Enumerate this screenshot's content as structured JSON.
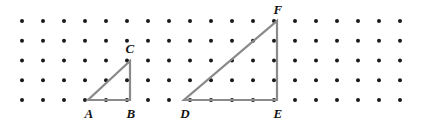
{
  "figure": {
    "width": 427,
    "height": 124,
    "background_color": "#ffffff"
  },
  "grid": {
    "name": "dot-grid",
    "dot_color": "#1a1a1a",
    "dot_radius": 2.0,
    "columns": 19,
    "rows": 5,
    "origin_x": 22,
    "origin_y": 21,
    "step_x": 21,
    "step_y": 19.75
  },
  "style": {
    "line_color": "#8a8a8a",
    "line_width": 2.2,
    "label_color": "#111111"
  },
  "shapes": [
    {
      "name": "triangle-abc",
      "label": "Triangle ABC",
      "points": "88,100 130,100 130,61",
      "vertices": [
        {
          "name": "A",
          "x": 88,
          "y": 100
        },
        {
          "name": "B",
          "x": 130,
          "y": 100
        },
        {
          "name": "C",
          "x": 130,
          "y": 61
        }
      ],
      "legs": {
        "horizontal_units": 2,
        "vertical_units": 2
      }
    },
    {
      "name": "triangle-def",
      "label": "Triangle DEF",
      "points": "184,100 277,100 277,21",
      "vertices": [
        {
          "name": "D",
          "x": 184,
          "y": 100
        },
        {
          "name": "E",
          "x": 277,
          "y": 100
        },
        {
          "name": "F",
          "x": 277,
          "y": 21
        }
      ],
      "legs": {
        "horizontal_units": 4.5,
        "vertical_units": 4
      }
    }
  ],
  "labels": [
    {
      "name": "label-a",
      "text": "A",
      "x": 89,
      "y": 113
    },
    {
      "name": "label-b",
      "text": "B",
      "x": 131,
      "y": 113
    },
    {
      "name": "label-c",
      "text": "C",
      "x": 130,
      "y": 48
    },
    {
      "name": "label-d",
      "text": "D",
      "x": 185,
      "y": 113
    },
    {
      "name": "label-e",
      "text": "E",
      "x": 278,
      "y": 113
    },
    {
      "name": "label-f",
      "text": "F",
      "x": 278,
      "y": 9
    }
  ]
}
